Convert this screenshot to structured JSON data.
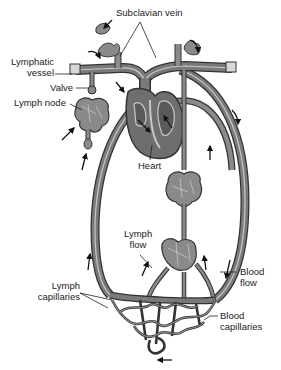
{
  "diagram": {
    "type": "lymphatic-system-schematic",
    "colors": {
      "vessel_fill": "#7a7a7a",
      "vessel_outline": "#333333",
      "vessel_highlight": "#c8c8c8",
      "node_fill": "#8a8a8a",
      "heart_fill": "#6e6e6e",
      "background": "#ffffff",
      "text": "#222222"
    },
    "labels": {
      "subclavian_vein": "Subclavian vein",
      "lymphatic_vessel_line1": "Lymphatic",
      "lymphatic_vessel_line2": "vessel",
      "valve": "Valve",
      "lymph_node": "Lymph node",
      "heart": "Heart",
      "lymph_flow_line1": "Lymph",
      "lymph_flow_line2": "flow",
      "blood_flow_line1": "Blood",
      "blood_flow_line2": "flow",
      "lymph_capillaries_line1": "Lymph",
      "lymph_capillaries_line2": "capillaries",
      "blood_capillaries_line1": "Blood",
      "blood_capillaries_line2": "capillaries"
    }
  }
}
